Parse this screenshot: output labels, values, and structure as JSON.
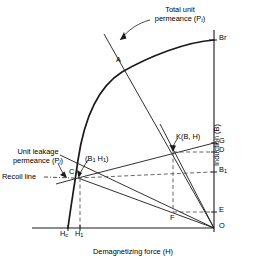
{
  "figure": {
    "axes": {
      "x_label": "Demagnetizing force (H)",
      "y_label": "Induction (B)"
    },
    "annotations": {
      "total_unit_permeance": "Total unit\npermeance (P",
      "total_unit_permeance_line1": "Total unit",
      "total_unit_permeance_line2_pre": "permeance (P",
      "total_unit_permeance_sub": "t",
      "total_unit_permeance_post": ")",
      "unit_leakage_permeance_line1": "Unit leakage",
      "unit_leakage_permeance_line2_pre": "permeance (P",
      "unit_leakage_permeance_sub": "l",
      "unit_leakage_permeance_post": ")",
      "recoil_line": "Recoil line",
      "b1h1_pre": "(B",
      "b1h1_sub1": "1",
      "b1h1_mid": " H",
      "b1h1_sub2": "1",
      "b1h1_post": ")",
      "k_point": "K(B, H)"
    },
    "points": [
      {
        "name": "A",
        "label": "A",
        "x": 116,
        "y": 56,
        "desc": "intersection of total unit permeance line and demagnetization curve"
      },
      {
        "name": "Br",
        "label": "Br",
        "x": 219,
        "y": 34,
        "desc": "remanent induction on B axis"
      },
      {
        "name": "G",
        "label": "G",
        "x": 219,
        "y": 137,
        "desc": "tick on B axis"
      },
      {
        "name": "D",
        "label": "D",
        "x": 219,
        "y": 146,
        "desc": "tick on B axis"
      },
      {
        "name": "B1",
        "label_pre": "B",
        "label_sub": "1",
        "x": 219,
        "y": 166,
        "desc": "induction B1 on B axis"
      },
      {
        "name": "E",
        "label": "E",
        "x": 219,
        "y": 206,
        "desc": "tick on B axis"
      },
      {
        "name": "O",
        "label": "O",
        "x": 219,
        "y": 222,
        "desc": "origin"
      },
      {
        "name": "C",
        "label": "C",
        "x": 69,
        "y": 168,
        "desc": "operating point on demagnetization curve"
      },
      {
        "name": "F",
        "label": "F",
        "x": 170,
        "y": 214,
        "desc": "point on lower load line"
      },
      {
        "name": "K",
        "label": "K(B, H)",
        "x": 176,
        "y": 133,
        "desc": "operating point on recoil line"
      }
    ],
    "axis_ticks": {
      "x": [
        {
          "label_pre": "H",
          "label_sub": "c",
          "x": 60,
          "y": 230
        },
        {
          "label_pre": "H",
          "label_sub": "1",
          "x": 75,
          "y": 230
        }
      ]
    },
    "geometry": {
      "origin": {
        "x": 214,
        "y": 228
      },
      "y_axis_top": 30,
      "x_axis_left": 32,
      "curve_top": {
        "x": 214,
        "y": 40
      },
      "curve_bottom": {
        "x": 68,
        "y": 228
      },
      "point_A": {
        "x": 124,
        "y": 69
      },
      "point_C": {
        "x": 78,
        "y": 178
      },
      "point_K": {
        "x": 173,
        "y": 152
      },
      "point_F": {
        "x": 175,
        "y": 210
      },
      "tick_Br_y": 40,
      "tick_G_y": 143,
      "tick_D_y": 152,
      "tick_B1_y": 172,
      "tick_E_y": 212,
      "Hc_x": 68,
      "H1_x": 80
    },
    "style": {
      "stroke": "#1a1a1a",
      "curve_stroke": "#1a1a1a",
      "dashed_stroke": "#555555",
      "background": "#ffffff"
    }
  }
}
